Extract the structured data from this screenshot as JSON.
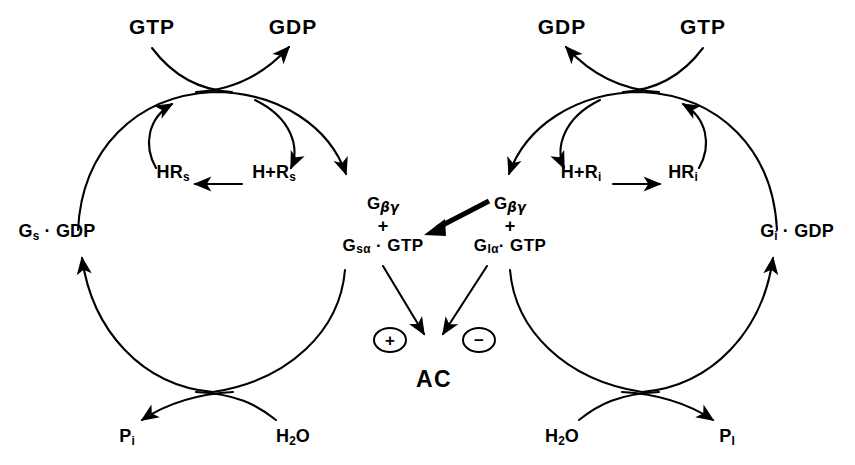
{
  "diagram": {
    "stroke_color": "#000000",
    "background_color": "#ffffff"
  },
  "left_cycle": {
    "name": "Gs stimulatory cycle",
    "gtp_in": "GTP",
    "gdp_out": "GDP",
    "receptor_bound": "HR",
    "receptor_bound_sub": "s",
    "receptor_free": "H+R",
    "receptor_free_sub": "s",
    "g_inactive": "G",
    "g_inactive_sub": "s",
    "g_inactive_tail": "· GDP",
    "active_beta_gamma": "G",
    "active_beta_gamma_sub": "βγ",
    "active_plus": "+",
    "active_alpha": "G",
    "active_alpha_sub": "sα",
    "active_alpha_tail": "· GTP",
    "water": "H",
    "water_sub": "2",
    "water_tail": "O",
    "phosphate": "P",
    "phosphate_sub": "i"
  },
  "right_cycle": {
    "name": "Gi inhibitory cycle",
    "gtp_in": "GTP",
    "gdp_out": "GDP",
    "receptor_bound": "HR",
    "receptor_bound_sub": "i",
    "receptor_free": "H+R",
    "receptor_free_sub": "i",
    "g_inactive": "G",
    "g_inactive_sub": "i",
    "g_inactive_tail": "· GDP",
    "active_beta_gamma": "G",
    "active_beta_gamma_sub": "βγ",
    "active_plus": "+",
    "active_alpha": "G",
    "active_alpha_sub": "Iα",
    "active_alpha_tail": "· GTP",
    "water": "H",
    "water_sub": "2",
    "water_tail": "O",
    "phosphate": "P",
    "phosphate_sub": "I"
  },
  "center": {
    "effector": "AC",
    "stimulation_sign": "+",
    "inhibition_sign": "−"
  }
}
